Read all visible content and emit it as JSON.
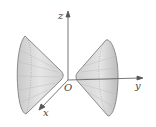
{
  "diagram": {
    "type": "3d-surface",
    "axes": {
      "z_label": "z",
      "y_label": "y",
      "x_label": "x",
      "origin_label": "O"
    },
    "colors": {
      "surface_fill": "#d8d8d8",
      "surface_edge": "#8a8a8a",
      "mesh": "#b0b0b0",
      "axis": "#555555"
    }
  }
}
